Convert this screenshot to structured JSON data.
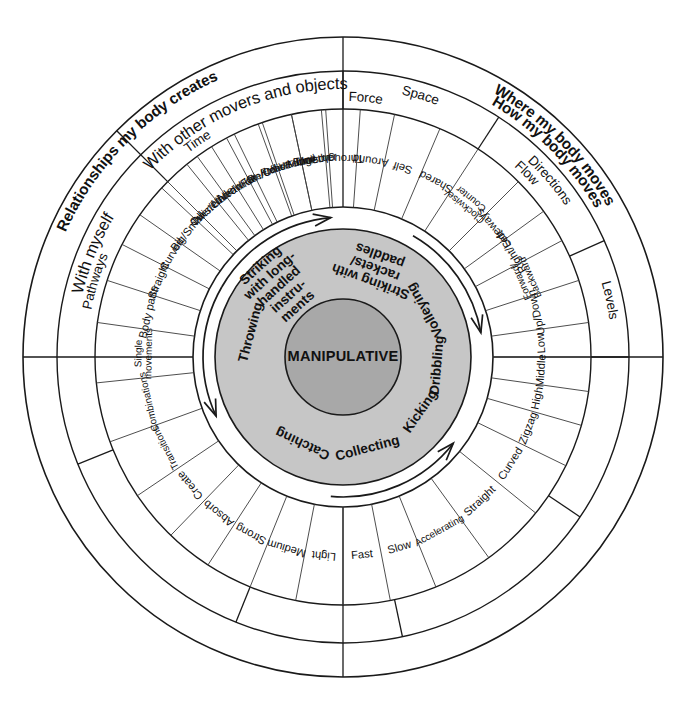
{
  "diagram": {
    "title": "MANIPULATIVE",
    "center_label": "MANIPULATIVE",
    "geometry": {
      "cx": 343,
      "cy": 357,
      "r_outer": 320,
      "r_quad_in": 286,
      "r_cat_out": 286,
      "r_cat_in": 248,
      "r_leaf_out": 248,
      "r_leaf_in": 150,
      "r_gap_out": 150,
      "r_gray_out": 128,
      "r_gray_in": 58
    },
    "colors": {
      "background": "#ffffff",
      "line": "#1a1a1a",
      "ring_gray": "#c6c6c6",
      "core_gray": "#a8a8a8",
      "text": "#111111"
    },
    "quadrants": [
      {
        "label": "Relationships my body creates",
        "start": 270,
        "end": 360,
        "bold": true
      },
      {
        "label": "Where my body moves",
        "start": 0,
        "end": 90,
        "bold": true
      },
      {
        "label": "How my body moves",
        "start": 180,
        "end": 270,
        "bold": true
      }
    ],
    "subquadrants": [
      {
        "label": "With myself",
        "start": 270,
        "end": 315
      },
      {
        "label": "With other movers and objects",
        "start": 315,
        "end": 360
      }
    ],
    "categories": [
      {
        "label": "Space",
        "start": 0,
        "end": 33
      },
      {
        "label": "Directions",
        "start": 33,
        "end": 66
      },
      {
        "label": "Levels",
        "start": 66,
        "end": 90
      },
      {
        "label": "Pathways",
        "start": 90,
        "end": 124
      },
      {
        "label": "Time",
        "start": 124,
        "end": 168
      },
      {
        "label": "Force",
        "start": 168,
        "end": 202
      },
      {
        "label": "Flow",
        "start": 202,
        "end": 248
      }
    ],
    "leaves": [
      {
        "label": "Over/Under",
        "start": 315,
        "end": 324
      },
      {
        "label": "Near/Far",
        "start": 324,
        "end": 332
      },
      {
        "label": "On/Off",
        "start": 332,
        "end": 340
      },
      {
        "label": "Front/Behind",
        "start": 340,
        "end": 348
      },
      {
        "label": "Together",
        "start": 348,
        "end": 356
      },
      {
        "label": "Through",
        "start": 356,
        "end": 364
      },
      {
        "label": "Around",
        "start": 364,
        "end": 372
      },
      {
        "label": "Self",
        "start": 372,
        "end": 383
      },
      {
        "label": "Shared",
        "start": 383,
        "end": 393
      },
      {
        "label": "Clockwise/ Counter",
        "start": 393,
        "end": 405,
        "two_line": true
      },
      {
        "label": "Sideways",
        "start": 405,
        "end": 414
      },
      {
        "label": "Right/Left",
        "start": 414,
        "end": 422
      },
      {
        "label": "Forward/ Backward",
        "start": 422,
        "end": 432,
        "two_line": true
      },
      {
        "label": "Up/Down",
        "start": 432,
        "end": 442
      },
      {
        "label": "Low",
        "start": 442,
        "end": 450
      },
      {
        "label": "Middle",
        "start": 450,
        "end": 458
      },
      {
        "label": "High",
        "start": 458,
        "end": 466
      },
      {
        "label": "Zigzag",
        "start": 466,
        "end": 476
      },
      {
        "label": "Curved",
        "start": 476,
        "end": 489
      },
      {
        "label": "Straight",
        "start": 489,
        "end": 504
      },
      {
        "label": "Accelerating",
        "start": 504,
        "end": 518
      },
      {
        "label": "Slow",
        "start": 518,
        "end": 529
      },
      {
        "label": "Fast",
        "start": 529,
        "end": 540
      },
      {
        "label": "Light",
        "start": 540,
        "end": 551
      },
      {
        "label": "Medium",
        "start": 551,
        "end": 562
      },
      {
        "label": "Strong",
        "start": 562,
        "end": 573
      },
      {
        "label": "Absorb",
        "start": 573,
        "end": 584
      },
      {
        "label": "Create",
        "start": 584,
        "end": 596
      },
      {
        "label": "Transitions",
        "start": 596,
        "end": 610
      },
      {
        "label": "Combinations",
        "start": 610,
        "end": 624
      },
      {
        "label": "Single movements",
        "start": 624,
        "end": 638,
        "two_line": true
      },
      {
        "label": "Body parts",
        "start": 638,
        "end": 648
      },
      {
        "label": "Straight",
        "start": 648,
        "end": 657
      },
      {
        "label": "Curved",
        "start": 657,
        "end": 665
      },
      {
        "label": "Big/Small",
        "start": 665,
        "end": 673
      },
      {
        "label": "Twisted",
        "start": 673,
        "end": 681
      },
      {
        "label": "Narrow",
        "start": 681,
        "end": 688
      },
      {
        "label": "wide",
        "start": 688,
        "end": 694
      },
      {
        "label": "Like/Unlike",
        "start": 694,
        "end": 701
      },
      {
        "label": "Lead/Follow",
        "start": 701,
        "end": 308
      },
      {
        "label": "Unison",
        "start": 308,
        "end": 315
      }
    ],
    "leaves_note_fix": [
      {
        "label": "Lead/Follow",
        "start": 701,
        "end": 708
      },
      {
        "label": "Unison",
        "start": 708,
        "end": 715
      },
      {
        "label": "Mirror",
        "start": 715,
        "end": 701
      }
    ],
    "core_skills": [
      {
        "label": "Throwing",
        "angle": 285
      },
      {
        "label": "Striking with long- handled instru- ments",
        "angle": 318,
        "multi": [
          "Striking",
          "with long-",
          "handled",
          "instru-",
          "ments"
        ]
      },
      {
        "label": "Striking with rackets/ paddles",
        "angle": 20,
        "multi": [
          "Striking with",
          "rackets/",
          "paddles"
        ]
      },
      {
        "label": "Volleying",
        "angle": 60
      },
      {
        "label": "Dribbling",
        "angle": 95
      },
      {
        "label": "Kicking",
        "angle": 125
      },
      {
        "label": "Collecting",
        "angle": 165
      },
      {
        "label": "Catching",
        "angle": 205
      }
    ],
    "arrows": [
      {
        "name": "arrow-top-left",
        "from": 300,
        "to": 245,
        "direction": "counterclockwise"
      },
      {
        "name": "arrow-top-right",
        "from": 300,
        "to": 355,
        "direction": "clockwise"
      },
      {
        "name": "arrow-bottom-left",
        "from": 185,
        "to": 128,
        "direction": "counterclockwise"
      },
      {
        "name": "arrow-bottom-right",
        "from": 30,
        "to": 80,
        "direction": "clockwise"
      }
    ]
  }
}
